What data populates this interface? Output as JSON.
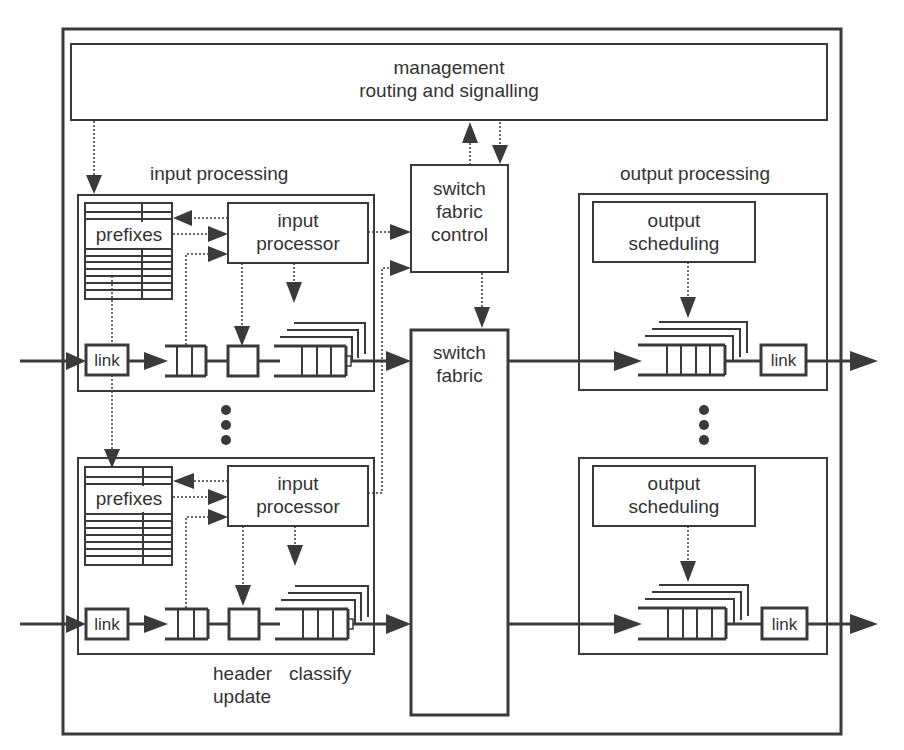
{
  "diagram": {
    "colors": {
      "stroke": "#3a3a3a",
      "background": "#ffffff",
      "text": "#333333"
    },
    "management": {
      "line1": "management",
      "line2": "routing and signalling"
    },
    "input_section_label": "input processing",
    "output_section_label": "output processing",
    "switch_fabric_control": {
      "line1": "switch",
      "line2": "fabric",
      "line3": "control"
    },
    "switch_fabric": {
      "line1": "switch",
      "line2": "fabric"
    },
    "input_units": [
      {
        "prefixes_label": "prefixes",
        "processor_line1": "input",
        "processor_line2": "processor",
        "link_label": "link"
      },
      {
        "prefixes_label": "prefixes",
        "processor_line1": "input",
        "processor_line2": "processor",
        "link_label": "link"
      }
    ],
    "output_units": [
      {
        "sched_line1": "output",
        "sched_line2": "scheduling",
        "link_label": "link"
      },
      {
        "sched_line1": "output",
        "sched_line2": "scheduling",
        "link_label": "link"
      }
    ],
    "annotations": {
      "header_line1": "header",
      "header_line2": "update",
      "classify": "classify"
    }
  }
}
